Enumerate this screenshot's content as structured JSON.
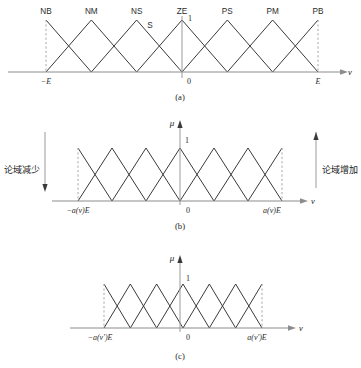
{
  "figure": {
    "axis_variable": "v",
    "membership_axis": "μ",
    "peak_value": "1",
    "origin_label": "0"
  },
  "panels": [
    {
      "id": "a",
      "caption": "(a)",
      "left_tick": "−E",
      "right_tick": "E",
      "axis_variable": "v",
      "show_mu_axis": false,
      "show_peak_label": false,
      "peak_value": "1",
      "terms": [
        "NB",
        "NM",
        "NS",
        "ZE",
        "PS",
        "PM",
        "PB"
      ],
      "extra_labels": [
        {
          "text": "S",
          "role": "slope-annotation"
        },
        {
          "text": "1",
          "role": "peak-annotation"
        }
      ]
    },
    {
      "id": "b",
      "caption": "(b)",
      "left_tick": "−a(v)E",
      "right_tick": "a(v)E",
      "axis_variable": "v",
      "membership_axis": "μ",
      "show_mu_axis": true,
      "show_peak_label": true,
      "peak_value": "1",
      "origin_label": "0",
      "annotation_left": "论域减少",
      "annotation_right": "论域增加"
    },
    {
      "id": "c",
      "caption": "(c)",
      "left_tick": "−a(v′)E",
      "right_tick": "a(v′)E",
      "axis_variable": "v",
      "membership_axis": "μ",
      "show_mu_axis": true,
      "show_peak_label": true,
      "peak_value": "1",
      "origin_label": "0"
    }
  ],
  "chart_data": {
    "type": "line",
    "xlabel": "v",
    "ylabel": "μ",
    "ylim": [
      0,
      1
    ],
    "grid": false,
    "legend": "none",
    "panels": [
      {
        "name": "(a)",
        "xlim": [
          -1,
          1
        ],
        "xticks": [
          -1,
          0,
          1
        ],
        "xticklabels": [
          "−E",
          "0",
          "E"
        ],
        "description": "Seven overlapping triangular membership functions spanning the full universe [−E, E]; adjacent triangles cross at μ = 0.5.",
        "series": [
          {
            "name": "NB",
            "peak_x": -1.0,
            "left_x": -1.3333,
            "right_x": -0.6667,
            "peak_y": 1
          },
          {
            "name": "NM",
            "peak_x": -0.6667,
            "left_x": -1.0,
            "right_x": -0.3333,
            "peak_y": 1
          },
          {
            "name": "NS",
            "peak_x": -0.3333,
            "left_x": -0.6667,
            "right_x": 0.0,
            "peak_y": 1
          },
          {
            "name": "ZE",
            "peak_x": 0.0,
            "left_x": -0.3333,
            "right_x": 0.3333,
            "peak_y": 1
          },
          {
            "name": "PS",
            "peak_x": 0.3333,
            "left_x": 0.0,
            "right_x": 0.6667,
            "peak_y": 1
          },
          {
            "name": "PM",
            "peak_x": 0.6667,
            "left_x": 0.3333,
            "right_x": 1.0,
            "peak_y": 1
          },
          {
            "name": "PB",
            "peak_x": 1.0,
            "left_x": 0.6667,
            "right_x": 1.3333,
            "peak_y": 1
          }
        ]
      },
      {
        "name": "(b)",
        "xlim": [
          -1,
          1
        ],
        "xticks": [
          -1,
          0,
          1
        ],
        "xticklabels": [
          "−a(v)E",
          "0",
          "a(v)E"
        ],
        "description": "Same seven triangular membership functions compressed onto the scaled universe [−a(v)E, a(v)E].",
        "series": [
          {
            "name": "NB",
            "peak_x": -1.0,
            "left_x": -1.3333,
            "right_x": -0.6667,
            "peak_y": 1
          },
          {
            "name": "NM",
            "peak_x": -0.6667,
            "left_x": -1.0,
            "right_x": -0.3333,
            "peak_y": 1
          },
          {
            "name": "NS",
            "peak_x": -0.3333,
            "left_x": -0.6667,
            "right_x": 0.0,
            "peak_y": 1
          },
          {
            "name": "ZE",
            "peak_x": 0.0,
            "left_x": -0.3333,
            "right_x": 0.3333,
            "peak_y": 1
          },
          {
            "name": "PS",
            "peak_x": 0.3333,
            "left_x": 0.0,
            "right_x": 0.6667,
            "peak_y": 1
          },
          {
            "name": "PM",
            "peak_x": 0.6667,
            "left_x": 0.3333,
            "right_x": 1.0,
            "peak_y": 1
          },
          {
            "name": "PB",
            "peak_x": 1.0,
            "left_x": 0.6667,
            "right_x": 1.3333,
            "peak_y": 1
          }
        ],
        "annotations": [
          {
            "text": "论域减少",
            "position": "left",
            "arrow": "down"
          },
          {
            "text": "论域增加",
            "position": "right",
            "arrow": "up"
          }
        ]
      },
      {
        "name": "(c)",
        "xlim": [
          -1,
          1
        ],
        "xticks": [
          -1,
          0,
          1
        ],
        "xticklabels": [
          "−a(v′)E",
          "0",
          "a(v′)E"
        ],
        "description": "Membership functions on the further contracted universe [−a(v′)E, a(v′)E].",
        "series": [
          {
            "name": "NB",
            "peak_x": -1.0,
            "left_x": -1.3333,
            "right_x": -0.6667,
            "peak_y": 1
          },
          {
            "name": "NM",
            "peak_x": -0.6667,
            "left_x": -1.0,
            "right_x": -0.3333,
            "peak_y": 1
          },
          {
            "name": "NS",
            "peak_x": -0.3333,
            "left_x": -0.6667,
            "right_x": 0.0,
            "peak_y": 1
          },
          {
            "name": "ZE",
            "peak_x": 0.0,
            "left_x": -0.3333,
            "right_x": 0.3333,
            "peak_y": 1
          },
          {
            "name": "PS",
            "peak_x": 0.3333,
            "left_x": 0.0,
            "right_x": 0.6667,
            "peak_y": 1
          },
          {
            "name": "PM",
            "peak_x": 0.6667,
            "left_x": 0.3333,
            "right_x": 1.0,
            "peak_y": 1
          },
          {
            "name": "PB",
            "peak_x": 1.0,
            "left_x": 0.6667,
            "right_x": 1.3333,
            "peak_y": 1
          }
        ]
      }
    ]
  }
}
